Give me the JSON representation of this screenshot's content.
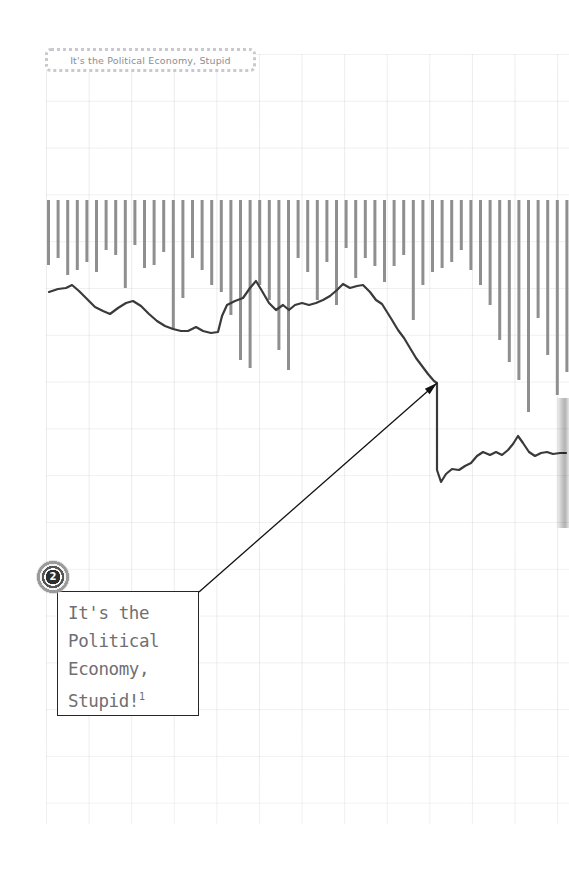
{
  "page": {
    "width": 569,
    "height": 878,
    "background_color": "#ffffff"
  },
  "header": {
    "title": "It's the Political Economy, Stupid",
    "border_color": "#c9c9cf",
    "text_color": "#8d8d93"
  },
  "callout": {
    "badge_number": "2",
    "text": "It's the\nPolitical\nEconomy,\nStupid!",
    "footnote_marker": "1",
    "text_color": "#6f6f73",
    "border_color": "#262626",
    "leader_from": [
      199,
      592
    ],
    "leader_to": [
      437,
      383
    ]
  },
  "colors": {
    "bar": "#8f8f8f",
    "line": "#3a3a3a",
    "grid": "#8c8c96",
    "annotation": "#111111"
  },
  "chart_data": {
    "type": "bar",
    "title": "It's the Political Economy, Stupid",
    "xlabel": "",
    "ylabel": "",
    "grid": true,
    "legend": "none",
    "bar_baseline_y": 200,
    "bar_x_start": 47,
    "bar_pitch": 9.6,
    "bar_width": 3,
    "bar_depths": [
      265,
      258,
      275,
      270,
      262,
      272,
      250,
      255,
      288,
      245,
      268,
      265,
      252,
      330,
      298,
      258,
      270,
      285,
      292,
      315,
      360,
      368,
      285,
      300,
      350,
      370,
      258,
      272,
      300,
      262,
      305,
      248,
      278,
      258,
      266,
      282,
      266,
      255,
      320,
      285,
      272,
      268,
      262,
      250,
      270,
      285,
      305,
      340,
      362,
      380,
      412,
      318,
      355,
      395,
      372,
      368,
      418,
      432,
      455,
      440,
      470,
      385,
      460,
      402,
      408,
      300,
      288,
      240,
      258,
      242,
      278,
      232,
      306,
      252,
      246,
      235,
      268,
      248,
      242,
      258,
      252,
      260,
      266,
      250,
      278,
      262,
      255,
      262,
      248,
      252,
      258,
      250,
      246,
      255,
      248,
      252,
      260,
      248,
      254,
      250,
      256,
      248,
      252,
      250,
      246,
      252,
      258,
      250,
      248
    ],
    "line_series_name": "trend",
    "line_points": [
      [
        49,
        292
      ],
      [
        58,
        289
      ],
      [
        66,
        288
      ],
      [
        72,
        285
      ],
      [
        79,
        291
      ],
      [
        87,
        299
      ],
      [
        95,
        307
      ],
      [
        103,
        311
      ],
      [
        110,
        314
      ],
      [
        118,
        308
      ],
      [
        126,
        303
      ],
      [
        133,
        301
      ],
      [
        141,
        306
      ],
      [
        149,
        314
      ],
      [
        157,
        321
      ],
      [
        165,
        326
      ],
      [
        173,
        329
      ],
      [
        181,
        331
      ],
      [
        188,
        331
      ],
      [
        196,
        327
      ],
      [
        203,
        331
      ],
      [
        211,
        333
      ],
      [
        218,
        332
      ],
      [
        222,
        316
      ],
      [
        227,
        305
      ],
      [
        235,
        301
      ],
      [
        243,
        298
      ],
      [
        250,
        288
      ],
      [
        256,
        281
      ],
      [
        262,
        291
      ],
      [
        269,
        303
      ],
      [
        276,
        310
      ],
      [
        283,
        305
      ],
      [
        289,
        310
      ],
      [
        295,
        305
      ],
      [
        302,
        303
      ],
      [
        309,
        305
      ],
      [
        316,
        303
      ],
      [
        323,
        300
      ],
      [
        330,
        296
      ],
      [
        337,
        290
      ],
      [
        343,
        284
      ],
      [
        350,
        288
      ],
      [
        357,
        286
      ],
      [
        363,
        285
      ],
      [
        370,
        292
      ],
      [
        376,
        300
      ],
      [
        382,
        304
      ],
      [
        387,
        312
      ],
      [
        392,
        320
      ],
      [
        398,
        330
      ],
      [
        404,
        338
      ],
      [
        410,
        348
      ],
      [
        416,
        358
      ],
      [
        422,
        366
      ],
      [
        428,
        374
      ],
      [
        434,
        381
      ],
      [
        437,
        383
      ],
      [
        437,
        470
      ],
      [
        441,
        482
      ],
      [
        446,
        474
      ],
      [
        452,
        469
      ],
      [
        459,
        470
      ],
      [
        465,
        466
      ],
      [
        471,
        463
      ],
      [
        477,
        456
      ],
      [
        483,
        452
      ],
      [
        490,
        455
      ],
      [
        496,
        452
      ],
      [
        502,
        455
      ],
      [
        508,
        450
      ],
      [
        513,
        444
      ],
      [
        518,
        436
      ],
      [
        523,
        443
      ],
      [
        529,
        452
      ],
      [
        535,
        456
      ],
      [
        541,
        453
      ],
      [
        547,
        452
      ],
      [
        553,
        454
      ],
      [
        560,
        453
      ],
      [
        566,
        453
      ]
    ]
  }
}
